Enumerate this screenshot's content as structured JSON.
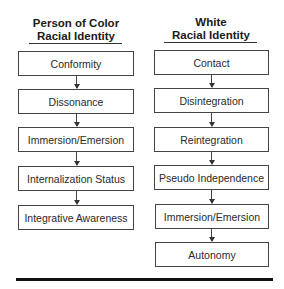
{
  "diagram": {
    "left": {
      "title_line1": "Person of Color",
      "title_line2": "Racial Identity",
      "stages": [
        "Conformity",
        "Dissonance",
        "Immersion/Emersion",
        "Internalization Status",
        "Integrative Awareness"
      ]
    },
    "right": {
      "title_line1": "White",
      "title_line2": "Racial Identity",
      "stages": [
        "Contact",
        "Disintegration",
        "Reintegration",
        "Pseudo Independence",
        "Immersion/Emersion",
        "Autonomy"
      ]
    }
  }
}
